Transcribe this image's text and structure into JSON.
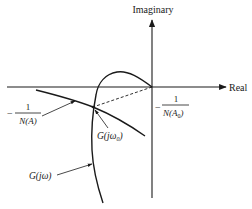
{
  "diagram": {
    "type": "nyquist-describing-function",
    "axes": {
      "imaginary_label": "Imaginary",
      "real_label": "Real"
    },
    "labels": {
      "neg_inv_NA": {
        "sign": "−",
        "numerator": "1",
        "denominator": "N(A)"
      },
      "neg_inv_NA0": {
        "sign": "−",
        "numerator": "1",
        "denominator_main": "N(A",
        "denominator_sub": "0",
        "denominator_close": ")"
      },
      "G_jw0": {
        "main": "G(jω",
        "sub": "0",
        "close": ")"
      },
      "G_jw": {
        "text": "G(jω)"
      }
    },
    "curves": [
      {
        "name": "G(jω)",
        "description": "Nyquist plot of G(jω), starts at origin, loops above real axis then descends through the third quadrant"
      },
      {
        "name": "-1/N(A)",
        "description": "Describing function locus, straight line in third quadrant descending to the right"
      },
      {
        "name": "dashed-ray",
        "description": "Dashed line from origin to intersection point G(jω0) = -1/N(A0)"
      }
    ],
    "colors": {
      "ink": "#1a1a1a",
      "background": "#ffffff"
    }
  }
}
